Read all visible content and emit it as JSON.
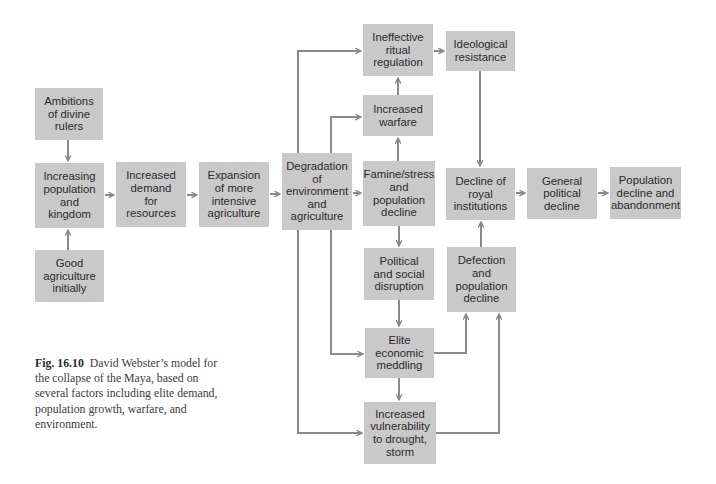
{
  "figure": {
    "colors": {
      "box_fill": "#c9c9c9",
      "arrow": "#8a8a8a",
      "text": "#2a2a2a"
    },
    "nodes": {
      "ambitions": "Ambitions\nof divine\nrulers",
      "increasing_population": "Increasing\npopulation\nand\nkingdom",
      "good_agriculture": "Good\nagriculture\ninitially",
      "increased_demand": "Increased\ndemand\nfor\nresources",
      "expansion": "Expansion\nof more\nintensive\nagriculture",
      "degradation": "Degradation\nof\nenvironment\nand\nagriculture",
      "ineffective_ritual": "Ineffective\nritual\nregulation",
      "ideological_resistance": "Ideological\nresistance",
      "increased_warfare": "Increased\nwarfare",
      "famine": "Famine/stress\nand\npopulation\ndecline",
      "political_social": "Political\nand social\ndisruption",
      "elite_meddling": "Elite\neconomic\nmeddling",
      "vulnerability": "Increased\nvulnerability\nto drought,\nstorm",
      "decline_royal": "Decline of\nroyal\ninstitutions",
      "defection": "Defection\nand\npopulation\ndecline",
      "general_political": "General\npolitical\ndecline",
      "population_abandonment": "Population\ndecline and\nabandonment"
    },
    "edges": [
      [
        "ambitions",
        "increasing_population"
      ],
      [
        "good_agriculture",
        "increasing_population"
      ],
      [
        "increasing_population",
        "increased_demand"
      ],
      [
        "increased_demand",
        "expansion"
      ],
      [
        "expansion",
        "degradation"
      ],
      [
        "degradation",
        "ineffective_ritual"
      ],
      [
        "degradation",
        "increased_warfare"
      ],
      [
        "degradation",
        "famine"
      ],
      [
        "degradation",
        "elite_meddling"
      ],
      [
        "degradation",
        "vulnerability"
      ],
      [
        "famine",
        "increased_warfare"
      ],
      [
        "increased_warfare",
        "ineffective_ritual"
      ],
      [
        "ineffective_ritual",
        "ideological_resistance"
      ],
      [
        "ideological_resistance",
        "decline_royal"
      ],
      [
        "famine",
        "political_social"
      ],
      [
        "political_social",
        "elite_meddling"
      ],
      [
        "elite_meddling",
        "vulnerability"
      ],
      [
        "elite_meddling",
        "defection"
      ],
      [
        "vulnerability",
        "defection"
      ],
      [
        "defection",
        "decline_royal"
      ],
      [
        "decline_royal",
        "general_political"
      ],
      [
        "general_political",
        "population_abandonment"
      ]
    ],
    "caption": {
      "label": "Fig. 16.10",
      "text": "David Webster’s model for the collapse of the Maya, based on several factors including elite demand, population growth, warfare, and environment."
    }
  }
}
